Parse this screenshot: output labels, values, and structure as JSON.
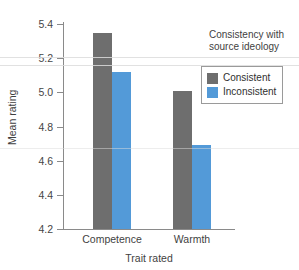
{
  "chart_data": {
    "type": "bar",
    "title": "",
    "xlabel": "Trait rated",
    "ylabel": "Mean rating",
    "categories": [
      "Competence",
      "Warmth"
    ],
    "series": [
      {
        "name": "Consistent",
        "color": "#6e6e6e",
        "values": [
          5.35,
          5.01
        ]
      },
      {
        "name": "Inconsistent",
        "color": "#539ad8",
        "values": [
          5.12,
          4.69
        ]
      }
    ],
    "ylim": [
      4.2,
      5.4
    ],
    "ytick_values": [
      4.2,
      4.4,
      4.6,
      4.8,
      5.0,
      5.2,
      5.4
    ],
    "ytick_labels": [
      "4.2",
      "4.4",
      "4.6",
      "4.8",
      "5.0",
      "5.2",
      "5.4"
    ],
    "grid": false,
    "legend_position": "upper-right",
    "legend_title": "Consistency with source ideology",
    "legend_title_lines": [
      "Consistency with",
      "source ideology"
    ],
    "legend_entries": [
      "Consistent",
      "Inconsistent"
    ]
  },
  "axes": {
    "y_label": "Mean rating",
    "x_label": "Trait rated",
    "y_ticks": [
      "5.4",
      "5.2",
      "5.0",
      "4.8",
      "4.6",
      "4.4",
      "4.2"
    ],
    "x_ticks": [
      "Competence",
      "Warmth"
    ]
  },
  "legend": {
    "title_line1": "Consistency with",
    "title_line2": "source ideology",
    "items": [
      {
        "label": "Consistent",
        "color": "#6e6e6e"
      },
      {
        "label": "Inconsistent",
        "color": "#539ad8"
      }
    ]
  },
  "colors": {
    "consistent": "#6e6e6e",
    "inconsistent": "#539ad8",
    "axis": "#8a8a8a",
    "text": "#3f3f3f"
  }
}
